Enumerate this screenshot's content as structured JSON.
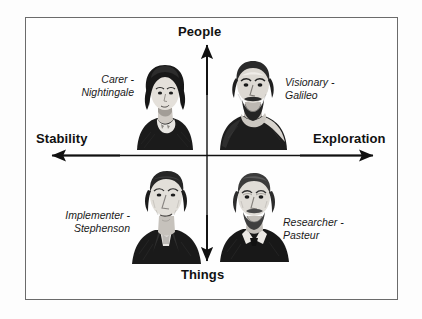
{
  "diagram": {
    "type": "2x2-quadrant-matrix",
    "axes": {
      "vertical": {
        "top_label": "People",
        "bottom_label": "Things"
      },
      "horizontal": {
        "left_label": "Stability",
        "right_label": "Exploration"
      }
    },
    "quadrants": [
      {
        "position": "top-left",
        "role": "Carer -",
        "person": "Nightingale",
        "portrait_icon": "portrait-nightingale-icon",
        "axis_combination": "People / Stability"
      },
      {
        "position": "top-right",
        "role": "Visionary -",
        "person": "Galileo",
        "portrait_icon": "portrait-galileo-icon",
        "axis_combination": "People / Exploration"
      },
      {
        "position": "bottom-left",
        "role": "Implementer -",
        "person": "Stephenson",
        "portrait_icon": "portrait-stephenson-icon",
        "axis_combination": "Things / Stability"
      },
      {
        "position": "bottom-right",
        "role": "Researcher -",
        "person": "Pasteur",
        "portrait_icon": "portrait-pasteur-icon",
        "axis_combination": "Things / Exploration"
      }
    ],
    "colors": {
      "background": "#fefefe",
      "frame": "#6b6b6b",
      "axis": "#111111",
      "text": "#111111"
    }
  }
}
